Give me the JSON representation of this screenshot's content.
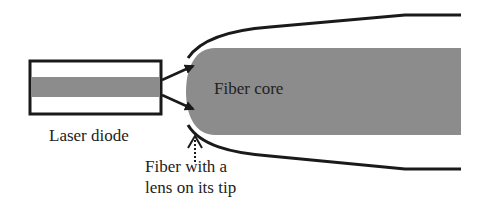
{
  "diagram": {
    "labels": {
      "fiber_core": "Fiber core",
      "laser_diode": "Laser diode",
      "lens_line1": "Fiber with a",
      "lens_line2": "lens on its tip"
    },
    "colors": {
      "core_fill": "#8c8c8c",
      "outline": "#1a1a1a",
      "background": "#ffffff",
      "text": "#222222"
    },
    "components": [
      {
        "id": "laser-diode",
        "type": "rectangle-with-active-stripe"
      },
      {
        "id": "beam-arrows",
        "type": "diverging-arrows",
        "count": 2
      },
      {
        "id": "fiber-core",
        "type": "rounded-tip-bar"
      },
      {
        "id": "fiber-cladding",
        "type": "tapered-outline"
      },
      {
        "id": "lens-pointer",
        "type": "dotted-arrow"
      }
    ]
  }
}
